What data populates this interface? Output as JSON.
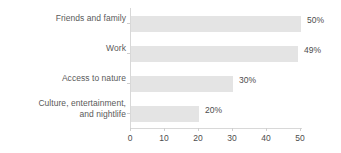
{
  "chart_data": {
    "type": "bar",
    "orientation": "horizontal",
    "title": "",
    "subtitle": "",
    "xlabel": "",
    "ylabel": "",
    "categories": [
      "Friends and family",
      "Work",
      "Access to nature",
      "Culture, entertainment, and nightlife"
    ],
    "values": [
      50,
      49,
      30,
      20
    ],
    "data_labels": [
      "50%",
      "49%",
      "30%",
      "20%"
    ],
    "xlim": [
      0,
      50
    ],
    "xticks": [
      0,
      10,
      20,
      30,
      40,
      50
    ],
    "xtick_labels": [
      "0",
      "10",
      "20",
      "30",
      "40",
      "50"
    ],
    "grid": false,
    "legend": false,
    "bar_color": "#e4e4e4",
    "axis_color": "#d8d8d8",
    "label_color": "#5a5a5a",
    "value_color": "#4d4d4d"
  },
  "categories_display": [
    {
      "line1": "Friends and family",
      "line2": "",
      "value_label": "50%"
    },
    {
      "line1": "Work",
      "line2": "",
      "value_label": "49%"
    },
    {
      "line1": "Access to nature",
      "line2": "",
      "value_label": "30%"
    },
    {
      "line1": "Culture, entertainment,",
      "line2": "and nightlife",
      "value_label": "20%"
    }
  ],
  "axis": {
    "tick_0": "0",
    "tick_1": "10",
    "tick_2": "20",
    "tick_3": "30",
    "tick_4": "40",
    "tick_5": "50"
  }
}
